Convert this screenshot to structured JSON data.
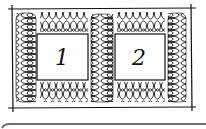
{
  "diagram": {
    "boxes": [
      {
        "label": "1"
      },
      {
        "label": "2"
      }
    ],
    "colors": {
      "ink": "#111111",
      "background": "#ffffff",
      "bottom_bar": "#6e6e6e"
    }
  }
}
